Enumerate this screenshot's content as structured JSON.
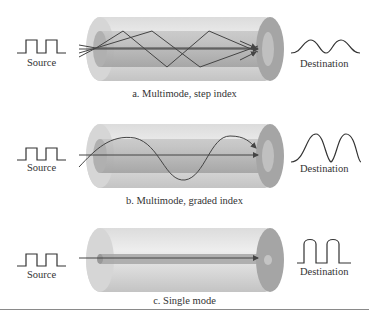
{
  "panels": [
    {
      "id": "a",
      "source_label": "Source",
      "destination_label": "Destination",
      "caption": "a. Multimode, step index",
      "propagation": "zigzag",
      "output_pulse": "broadened-overlapping"
    },
    {
      "id": "b",
      "source_label": "Source",
      "destination_label": "Destination",
      "caption": "b. Multimode, graded index",
      "propagation": "sinusoidal",
      "output_pulse": "gaussian-overlapping"
    },
    {
      "id": "c",
      "source_label": "Source",
      "destination_label": "Destination",
      "caption": "c. Single mode",
      "propagation": "straight",
      "output_pulse": "rounded-square"
    }
  ],
  "colors": {
    "cladding": "#c8c8c8",
    "core": "#a8a8a8",
    "end_face": "#9a9a9a",
    "ray": "#444444"
  }
}
